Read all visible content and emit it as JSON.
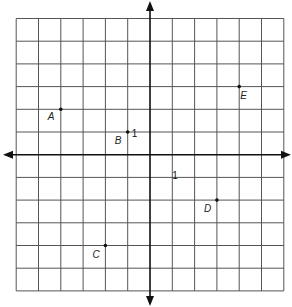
{
  "figure": {
    "type": "coordinate-plane",
    "grid": {
      "x_min": -6,
      "x_max": 6,
      "y_min": -6,
      "y_max": 6,
      "cell_px_x": 22.3,
      "cell_px_y": 22.7
    },
    "origin_px": {
      "x": 150,
      "y": 154.7
    },
    "colors": {
      "grid": "#555555",
      "axis": "#111111",
      "point": "#111111",
      "label": "#222222"
    },
    "unit_labels": [
      {
        "text": "1",
        "x": 0,
        "y": 1,
        "dx": -17,
        "dy": 4
      },
      {
        "text": "1",
        "x": 1,
        "y": -1,
        "dx": 0,
        "dy": 2
      }
    ],
    "points": [
      {
        "name": "A",
        "label": "A",
        "x": -4,
        "y": 2,
        "label_dx": -13,
        "label_dy": 11
      },
      {
        "name": "B",
        "label": "B",
        "x": -1,
        "y": 1,
        "label_dx": -13,
        "label_dy": 12
      },
      {
        "name": "C",
        "label": "C",
        "x": -2,
        "y": -4,
        "label_dx": -13,
        "label_dy": 12
      },
      {
        "name": "D",
        "label": "D",
        "x": 3,
        "y": -2,
        "label_dx": -13,
        "label_dy": 12
      },
      {
        "name": "E",
        "label": "E",
        "x": 4,
        "y": 3,
        "label_dx": 1,
        "label_dy": 12
      }
    ]
  }
}
